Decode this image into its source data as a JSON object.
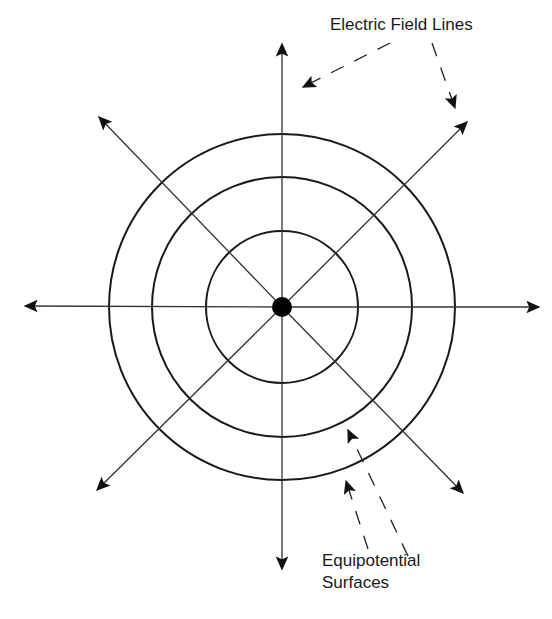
{
  "diagram": {
    "center": {
      "x": 282,
      "y": 307
    },
    "charge": {
      "radius": 10,
      "color": "#000000",
      "label": "point charge"
    },
    "equipotential_radii": [
      76,
      130,
      173
    ],
    "field_lines": [
      {
        "direction": "up",
        "tip": [
          282,
          44
        ]
      },
      {
        "direction": "down",
        "tip": [
          282,
          569
        ]
      },
      {
        "direction": "left",
        "tip": [
          25,
          306
        ]
      },
      {
        "direction": "right",
        "tip": [
          539,
          307
        ]
      },
      {
        "direction": "up-left",
        "tip": [
          99,
          117
        ]
      },
      {
        "direction": "up-right",
        "tip": [
          467,
          122
        ]
      },
      {
        "direction": "down-left",
        "tip": [
          97,
          490
        ]
      },
      {
        "direction": "down-right",
        "tip": [
          463,
          493
        ]
      }
    ],
    "colors": {
      "line": "#333333",
      "circle": "#1a1a1a",
      "background": "#ffffff"
    }
  },
  "annotations": {
    "field_lines_label": "Electric Field Lines",
    "equipotential_label_line1": "Equipotential",
    "equipotential_label_line2": "Surfaces",
    "field_pointers": [
      {
        "from": [
          390,
          43
        ],
        "to": [
          303,
          87
        ]
      },
      {
        "from": [
          432,
          43
        ],
        "to": [
          455,
          108
        ]
      }
    ],
    "equipotential_pointers": [
      {
        "from": [
          368,
          549
        ],
        "to": [
          346,
          481
        ]
      },
      {
        "from": [
          408,
          556
        ],
        "to": [
          348,
          430
        ]
      }
    ]
  }
}
